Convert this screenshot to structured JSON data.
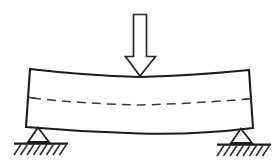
{
  "diagram": {
    "title": "Simply supported beam deflection under central point load",
    "type": "engineering-beam-diagram",
    "background_color": "#ffffff",
    "line_color": "#1c1c1c",
    "fill_color": "#ffffff",
    "elements": {
      "load_arrow": {
        "name": "downward-point-load-arrow",
        "style": "hollow-block-arrow",
        "direction": "down",
        "shaft": {
          "x_left": 133,
          "x_right": 147,
          "y_top": 14,
          "y_bottom": 56
        },
        "head": {
          "x_left": 125,
          "x_right": 155,
          "y_top": 56,
          "tip_x": 140,
          "tip_y": 76
        }
      },
      "beam": {
        "name": "deflected-beam",
        "shape": "sagging-curved-beam",
        "top_left": {
          "x": 30,
          "y": 69
        },
        "top_right": {
          "x": 249,
          "y": 70
        },
        "bottom_right": {
          "x": 253,
          "y": 128
        },
        "bottom_left": {
          "x": 26,
          "y": 127
        },
        "top_mid_sag": {
          "x": 140,
          "y": 77
        },
        "bottom_mid_sag": {
          "x": 140,
          "y": 133
        }
      },
      "neutral_axis": {
        "name": "neutral-axis-dashed-line",
        "style": "dashed",
        "start": {
          "x": 30,
          "y": 98
        },
        "mid": {
          "x": 140,
          "y": 105
        },
        "end": {
          "x": 250,
          "y": 99
        }
      },
      "supports": [
        {
          "name": "left-pinned-support",
          "apex": {
            "x": 38,
            "y": 127
          },
          "base_left": {
            "x": 28,
            "y": 142
          },
          "base_right": {
            "x": 49,
            "y": 142
          },
          "ground_line": {
            "x_start": 14,
            "x_end": 68,
            "y": 144
          },
          "hatch_count": 8
        },
        {
          "name": "right-pinned-support",
          "apex": {
            "x": 241,
            "y": 128
          },
          "base_left": {
            "x": 231,
            "y": 143
          },
          "base_right": {
            "x": 252,
            "y": 143
          },
          "ground_line": {
            "x_start": 217,
            "x_end": 271,
            "y": 145
          },
          "hatch_count": 8
        }
      ]
    }
  }
}
